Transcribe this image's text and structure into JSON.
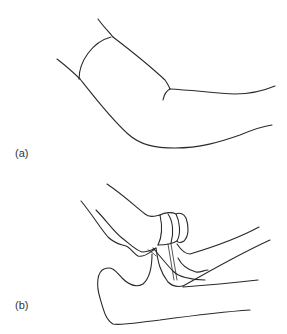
{
  "figure": {
    "panels": [
      {
        "id": "a",
        "label": "(a)",
        "description": "External outline of a bent arm at the elbow"
      },
      {
        "id": "b",
        "label": "(b)",
        "description": "Bones of the elbow joint: humerus, radius and ulna"
      }
    ],
    "colors": {
      "line": "#2a2a2a",
      "background": "#ffffff",
      "label": "#333333"
    }
  }
}
